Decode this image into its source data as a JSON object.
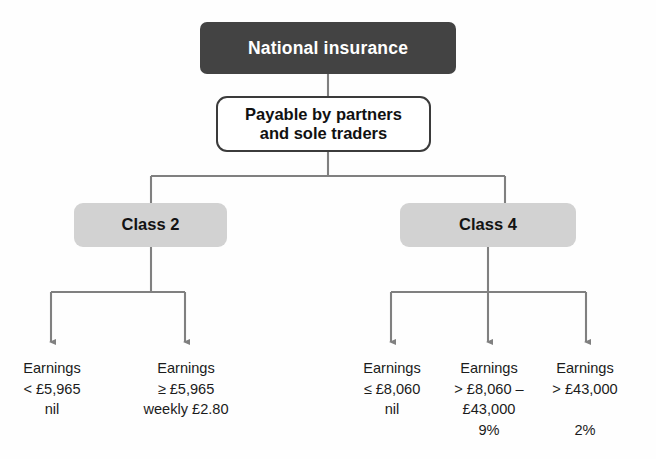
{
  "diagram": {
    "title": "National insurance",
    "colors": {
      "root_fill": "#434343",
      "root_text": "#ffffff",
      "sub_fill": "#ffffff",
      "sub_border": "#3b3b3b",
      "class_fill": "#d2d2d2",
      "connector": "#808080",
      "text": "#1b1b1b",
      "background": "#fefefe"
    },
    "nodes": {
      "root": {
        "label": "National insurance"
      },
      "subtitle": {
        "line1": "Payable by partners",
        "line2": "and sole traders",
        "label": "Payable by partners and sole traders"
      },
      "class2": {
        "label": "Class 2"
      },
      "class4": {
        "label": "Class 4"
      }
    },
    "leaves": [
      {
        "id": "class2-lower",
        "parent": "Class 2",
        "line1": "Earnings",
        "line2": "< £5,965",
        "line3": "nil",
        "line4": "",
        "text": "Earnings\n< £5,965\nnil"
      },
      {
        "id": "class2-upper",
        "parent": "Class 2",
        "line1": "Earnings",
        "line2": "≥ £5,965",
        "line3": "weekly £2.80",
        "line4": "",
        "text": "Earnings\n≥ £5,965\nweekly £2.80"
      },
      {
        "id": "class4-band1",
        "parent": "Class 4",
        "line1": "Earnings",
        "line2": "≤ £8,060",
        "line3": "nil",
        "line4": "",
        "text": "Earnings\n≤ £8,060\nnil"
      },
      {
        "id": "class4-band2",
        "parent": "Class 4",
        "line1": "Earnings",
        "line2": "> £8,060 –",
        "line3": "£43,000",
        "line4": "9%",
        "text": "Earnings\n> £8,060 –\n£43,000\n9%"
      },
      {
        "id": "class4-band3",
        "parent": "Class 4",
        "line1": "Earnings",
        "line2": "> £43,000",
        "line3": "",
        "line4": "2%",
        "text": "Earnings\n> £43,000\n\n2%"
      }
    ]
  }
}
